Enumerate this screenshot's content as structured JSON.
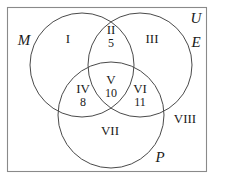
{
  "figure": {
    "type": "venn-diagram-3-set",
    "universe_label": "U",
    "stroke_color": "#4a4a4a",
    "border_color": "#8a8a8a",
    "background": "#ffffff"
  },
  "sets": [
    {
      "id": "M",
      "label": "M",
      "position": "left",
      "cx": 82,
      "cy": 65,
      "r": 52
    },
    {
      "id": "E",
      "label": "E",
      "position": "right",
      "cx": 140,
      "cy": 65,
      "r": 52
    },
    {
      "id": "P",
      "label": "P",
      "position": "bottom",
      "cx": 111,
      "cy": 115,
      "r": 53
    }
  ],
  "set_labels": [
    {
      "name": "M",
      "x": 24,
      "y": 40
    },
    {
      "name": "E",
      "x": 196,
      "y": 42
    },
    {
      "name": "P",
      "x": 160,
      "y": 157
    },
    {
      "name": "U",
      "x": 196,
      "y": 18
    }
  ],
  "regions": [
    {
      "roman": "I",
      "count": "",
      "x": 68,
      "y": 38,
      "desc": "M only"
    },
    {
      "roman": "II",
      "count": "5",
      "x": 111,
      "y": 36,
      "desc": "M and E only"
    },
    {
      "roman": "III",
      "count": "",
      "x": 152,
      "y": 38,
      "desc": "E only"
    },
    {
      "roman": "IV",
      "count": "8",
      "x": 83,
      "y": 95,
      "desc": "M and P only"
    },
    {
      "roman": "V",
      "count": "10",
      "x": 111,
      "y": 86,
      "desc": "M and E and P"
    },
    {
      "roman": "VI",
      "count": "11",
      "x": 140,
      "y": 95,
      "desc": "E and P only"
    },
    {
      "roman": "VII",
      "count": "",
      "x": 110,
      "y": 130,
      "desc": "P only"
    },
    {
      "roman": "VIII",
      "count": "",
      "x": 185,
      "y": 118,
      "desc": "outside all sets"
    }
  ]
}
